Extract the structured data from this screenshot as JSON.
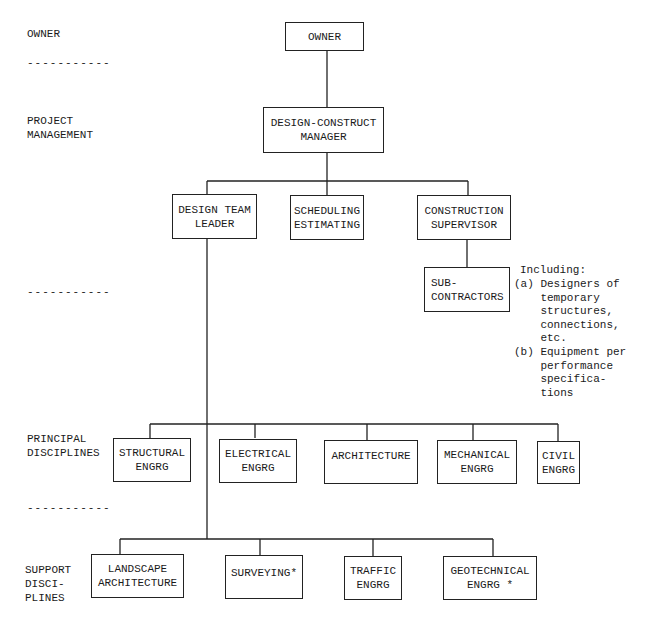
{
  "levels": {
    "owner": "OWNER",
    "project_management": "PROJECT\nMANAGEMENT",
    "principal_disciplines": "PRINCIPAL\nDISCIPLINES",
    "support_disciplines": "SUPPORT\nDISCI-\nPLINES",
    "separator": "-----------"
  },
  "nodes": {
    "owner": "OWNER",
    "dcm": "DESIGN-CONSTRUCT\nMANAGER",
    "design_team_leader": "DESIGN TEAM\nLEADER",
    "scheduling": "SCHEDULING\nESTIMATING",
    "construction_supervisor": "CONSTRUCTION\nSUPERVISOR",
    "subcontractors": "SUB-\nCONTRACTORS",
    "structural": "STRUCTURAL\nENGRG",
    "electrical": "ELECTRICAL\nENGRG",
    "architecture": "ARCHITECTURE",
    "mechanical": "MECHANICAL\nENGRG",
    "civil": "CIVIL\nENGRG",
    "landscape": "LANDSCAPE\nARCHITECTURE",
    "surveying": "SURVEYING*",
    "traffic": "TRAFFIC\nENGRG",
    "geotechnical": "GEOTECHNICAL\nENGRG *"
  },
  "note": {
    "title": "Including:",
    "a": "(a) Designers of\n    temporary\n    structures,\n    connections,\n    etc.",
    "b": "(b) Equipment per\n    performance\n    specifica-\n    tions"
  },
  "colors": {
    "line": "#222222",
    "text": "#1a1a1a",
    "background": "#ffffff"
  }
}
